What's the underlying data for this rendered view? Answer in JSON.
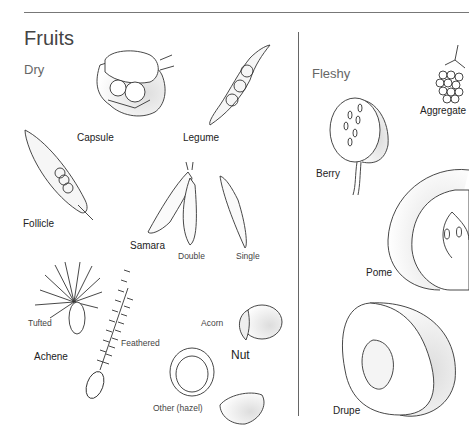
{
  "title": "Fruits",
  "sections": {
    "dry": {
      "heading": "Dry",
      "labels": {
        "capsule": "Capsule",
        "legume": "Legume",
        "follicle": "Follicle",
        "samara": "Samara",
        "samara_double": "Double",
        "samara_single": "Single",
        "achene": "Achene",
        "achene_tufted": "Tufted",
        "achene_feathered": "Feathered",
        "nut": "Nut",
        "nut_acorn": "Acorn",
        "nut_other": "Other (hazel)"
      }
    },
    "fleshy": {
      "heading": "Fleshy",
      "labels": {
        "aggregate": "Aggregate",
        "berry": "Berry",
        "pome": "Pome",
        "drupe": "Drupe"
      }
    }
  }
}
